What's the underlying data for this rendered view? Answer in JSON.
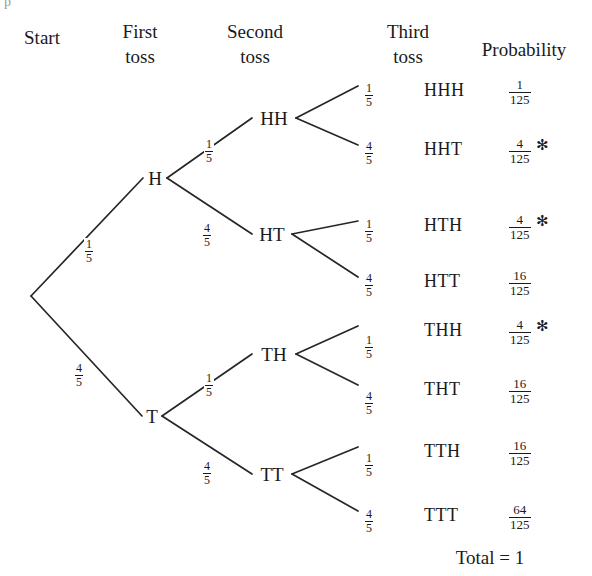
{
  "figure": {
    "type": "probability-tree",
    "artifact_glyph": "p"
  },
  "headers": [
    {
      "name": "start",
      "line1": "Start",
      "line2": "",
      "x": 42,
      "y": 28
    },
    {
      "name": "first-toss",
      "line1": "First",
      "line2": "toss",
      "x": 140,
      "y": 22
    },
    {
      "name": "second-toss",
      "line1": "Second",
      "line2": "toss",
      "x": 255,
      "y": 22
    },
    {
      "name": "third-toss",
      "line1": "Third",
      "line2": "toss",
      "x": 408,
      "y": 22
    },
    {
      "name": "probability",
      "line1": "Probability",
      "line2": "",
      "x": 524,
      "y": 40
    }
  ],
  "nodes": [
    {
      "name": "root",
      "label": "",
      "x": 31,
      "y": 300
    },
    {
      "name": "h",
      "label": "H",
      "x": 155,
      "y": 182
    },
    {
      "name": "t",
      "label": "T",
      "x": 152,
      "y": 420
    },
    {
      "name": "hh",
      "label": "HH",
      "x": 274,
      "y": 122
    },
    {
      "name": "ht",
      "label": "HT",
      "x": 272,
      "y": 238
    },
    {
      "name": "th",
      "label": "TH",
      "x": 274,
      "y": 358
    },
    {
      "name": "tt",
      "label": "TT",
      "x": 272,
      "y": 478
    }
  ],
  "edges": [
    {
      "name": "edge-root-h",
      "from": "root",
      "to": "h",
      "label_num": "1",
      "label_den": "5",
      "lx": 84,
      "ly": 238
    },
    {
      "name": "edge-root-t",
      "from": "root",
      "to": "t",
      "label_num": "4",
      "label_den": "5",
      "lx": 74,
      "ly": 362
    },
    {
      "name": "edge-h-hh",
      "from": "h",
      "to": "hh",
      "label_num": "1",
      "label_den": "5",
      "lx": 204,
      "ly": 138
    },
    {
      "name": "edge-h-ht",
      "from": "h",
      "to": "ht",
      "label_num": "4",
      "label_den": "5",
      "lx": 202,
      "ly": 222
    },
    {
      "name": "edge-t-th",
      "from": "t",
      "to": "th",
      "label_num": "1",
      "label_den": "5",
      "lx": 204,
      "ly": 372
    },
    {
      "name": "edge-t-tt",
      "from": "t",
      "to": "tt",
      "label_num": "4",
      "label_den": "5",
      "lx": 202,
      "ly": 460
    },
    {
      "name": "edge-hh-hhh",
      "from": "hh",
      "to": "l1",
      "label_num": "1",
      "label_den": "5",
      "lx": 364,
      "ly": 82
    },
    {
      "name": "edge-hh-hht",
      "from": "hh",
      "to": "l2",
      "label_num": "4",
      "label_den": "5",
      "lx": 364,
      "ly": 140
    },
    {
      "name": "edge-ht-hth",
      "from": "ht",
      "to": "l3",
      "label_num": "1",
      "label_den": "5",
      "lx": 364,
      "ly": 218
    },
    {
      "name": "edge-ht-htt",
      "from": "ht",
      "to": "l4",
      "label_num": "4",
      "label_den": "5",
      "lx": 364,
      "ly": 272
    },
    {
      "name": "edge-th-thh",
      "from": "th",
      "to": "l5",
      "label_num": "1",
      "label_den": "5",
      "lx": 364,
      "ly": 334
    },
    {
      "name": "edge-th-tht",
      "from": "th",
      "to": "l6",
      "label_num": "4",
      "label_den": "5",
      "lx": 364,
      "ly": 390
    },
    {
      "name": "edge-tt-tth",
      "from": "tt",
      "to": "l7",
      "label_num": "1",
      "label_den": "5",
      "lx": 364,
      "ly": 452
    },
    {
      "name": "edge-tt-ttt",
      "from": "tt",
      "to": "l8",
      "label_num": "4",
      "label_den": "5",
      "lx": 364,
      "ly": 508
    }
  ],
  "outcomes": [
    {
      "name": "outcome-hhh",
      "label": "HHH",
      "y": 90,
      "prob_num": "1",
      "prob_den": "125",
      "starred": false
    },
    {
      "name": "outcome-hht",
      "label": "HHT",
      "y": 149,
      "prob_num": "4",
      "prob_den": "125",
      "starred": true
    },
    {
      "name": "outcome-hth",
      "label": "HTH",
      "y": 225,
      "prob_num": "4",
      "prob_den": "125",
      "starred": true
    },
    {
      "name": "outcome-htt",
      "label": "HTT",
      "y": 281,
      "prob_num": "16",
      "prob_den": "125",
      "starred": false
    },
    {
      "name": "outcome-thh",
      "label": "THH",
      "y": 330,
      "prob_num": "4",
      "prob_den": "125",
      "starred": true
    },
    {
      "name": "outcome-tht",
      "label": "THT",
      "y": 389,
      "prob_num": "16",
      "prob_den": "125",
      "starred": false
    },
    {
      "name": "outcome-tth",
      "label": "TTH",
      "y": 451,
      "prob_num": "16",
      "prob_den": "125",
      "starred": false
    },
    {
      "name": "outcome-ttt",
      "label": "TTT",
      "y": 515,
      "prob_num": "64",
      "prob_den": "125",
      "starred": false
    }
  ],
  "star_symbol": "✻",
  "total": {
    "label": "Total = 1",
    "x": 490,
    "y": 548
  },
  "geometry": {
    "outcome_x": 424,
    "prob_x": 508,
    "leaf_tip_x": 358,
    "stroke_color": "#262626",
    "stroke_width": 1.7
  }
}
